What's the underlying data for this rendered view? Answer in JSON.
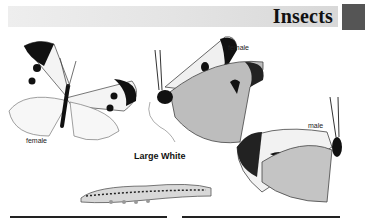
{
  "header": {
    "title": "Insects",
    "accent_color": "#555555"
  },
  "illustrations": [
    {
      "id": "large-white-female-open",
      "label": "female"
    },
    {
      "id": "large-white-female-side",
      "label": "female"
    },
    {
      "id": "large-white-male-side",
      "label": "male"
    },
    {
      "id": "large-white-caterpillar",
      "label": ""
    }
  ],
  "caption": "Large White"
}
